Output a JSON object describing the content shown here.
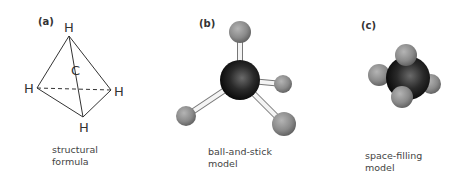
{
  "panels": [
    {
      "label": "(a)",
      "caption": [
        "structural",
        "formula"
      ],
      "atoms": {
        "top": "H",
        "center": "C",
        "left": "H",
        "right": "H",
        "bottom": "H"
      }
    },
    {
      "label": "(b)",
      "caption": [
        "ball-and-stick",
        "model"
      ]
    },
    {
      "label": "(c)",
      "caption": [
        "space-filling",
        "model"
      ]
    }
  ],
  "colors": {
    "carbon": "#1a1a1a",
    "hydrogen": "#8c8c8c",
    "stick": "#f2f2f2",
    "line": "#333333"
  }
}
